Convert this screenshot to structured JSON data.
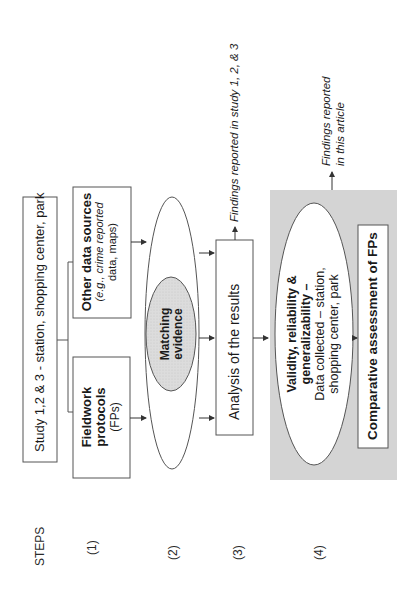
{
  "diagram": {
    "orientation": "rotated-90-ccw",
    "steps_header": "STEPS",
    "steps": [
      "(1)",
      "(2)",
      "(3)",
      "(4)"
    ],
    "study_box": "Study 1,2 & 3 - station, shopping center, park",
    "fieldwork_box": {
      "title_line1": "Fieldwork",
      "title_line2": "protocols",
      "subtitle": "(FPs)"
    },
    "other_sources_box": {
      "title": "Other data sources",
      "sub_line1": "(e.g., crime reported",
      "sub_line2": "data, maps)"
    },
    "matching_evidence": {
      "line1": "Matching",
      "line2": "evidence"
    },
    "analysis_box": "Analysis of the results",
    "findings_study": "Findings reported in study 1, 2, & 3",
    "validity_ellipse": {
      "line1": "Validity, reliability &",
      "line2": "generalizability –",
      "line3": "Data collected – station,",
      "line4": "shopping center, park"
    },
    "comparative_box": "Comparative assessment of FPs",
    "findings_article": {
      "line1": "Findings reported",
      "line2": "in this article"
    },
    "colors": {
      "shaded_panel": "#d4d4d4",
      "matching_fill": "#d9d9d9",
      "stroke": "#4a4a4a"
    }
  }
}
